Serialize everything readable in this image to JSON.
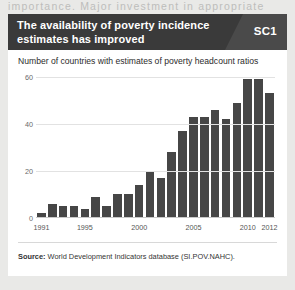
{
  "page": {
    "text_fragment_above": "importance. Major investment in appropriate"
  },
  "figure": {
    "header_title": "The availability of poverty incidence estimates has improved",
    "badge_label": "SC1",
    "subtitle": "Number of countries with estimates of poverty headcount ratios",
    "source_prefix": "Source:",
    "source_text": "World Development Indicators database (SI.POV.NAHC).",
    "colors": {
      "header_band": "#3a3a3a",
      "badge_wedge": "#4a4a4a",
      "bar": "#464646",
      "gridline": "#e2e2e2",
      "page_background": "#e9e9e7",
      "figure_background": "#ffffff"
    }
  },
  "chart_data": {
    "type": "bar",
    "title": "Number of countries with estimates of poverty headcount ratios",
    "xlabel": "",
    "ylabel": "",
    "ylim": [
      0,
      62
    ],
    "yticks": [
      0,
      20,
      40,
      60
    ],
    "ytick_labels": [
      "0",
      "20",
      "40",
      "60"
    ],
    "grid": true,
    "legend": "none",
    "categories": [
      "1991",
      "1992",
      "1993",
      "1994",
      "1995",
      "1996",
      "1997",
      "1998",
      "1999",
      "2000",
      "2001",
      "2002",
      "2003",
      "2004",
      "2005",
      "2006",
      "2007",
      "2008",
      "2009",
      "2010",
      "2011",
      "2012"
    ],
    "xtick_labels": [
      "1991",
      "1995",
      "2000",
      "2005",
      "2010",
      "2012"
    ],
    "values": [
      2,
      6,
      5,
      5,
      4,
      9,
      5,
      10,
      10,
      14,
      20,
      17,
      28,
      37,
      43,
      43,
      46,
      42,
      49,
      59,
      59,
      53
    ]
  }
}
